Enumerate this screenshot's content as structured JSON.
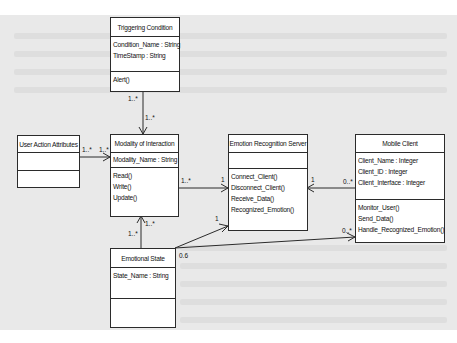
{
  "classes": {
    "triggering_condition": {
      "name": "Triggering Condition",
      "attributes": [
        "Condition_Name : String",
        "TimeStamp : String"
      ],
      "operations": [
        "Alert()"
      ]
    },
    "modality_of_interaction": {
      "name": "Modality of Interaction",
      "attributes": [
        "Modality_Name : String"
      ],
      "operations": [
        "Read()",
        "Write()",
        "Update()"
      ]
    },
    "user_action_attributes": {
      "name": "User Action Attributes",
      "attributes": [],
      "operations": []
    },
    "emotion_recognition_server": {
      "name": "Emotion Recognition Server",
      "attributes": [],
      "operations": [
        "Connect_Client()",
        "Disconnect_Client()",
        "Receive_Data()",
        "Recognized_Emotion()"
      ]
    },
    "mobile_client": {
      "name": "Mobile Client",
      "attributes": [
        "Client_Name : Integer",
        "Client_ID : Integer",
        "Client_Interface : Integer"
      ],
      "operations": [
        "Monitor_User()",
        "Send_Data()",
        "Handle_Recognized_Emotion()"
      ]
    },
    "emotional_state": {
      "name": "Emotional State",
      "attributes": [
        "State_Name : String"
      ],
      "operations": []
    }
  },
  "associations": [
    {
      "from": "Triggering Condition",
      "to": "Modality of Interaction",
      "from_mult": "1..*",
      "to_mult": "1..*"
    },
    {
      "from": "User Action Attributes",
      "to": "Modality of Interaction",
      "from_mult": "1..*",
      "to_mult": "1..*"
    },
    {
      "from": "Modality of Interaction",
      "to": "Emotion Recognition Server",
      "from_mult": "1..*",
      "to_mult": "1"
    },
    {
      "from": "Mobile Client",
      "to": "Emotion Recognition Server",
      "from_mult": "0..*",
      "to_mult": "1"
    },
    {
      "from": "Emotional State",
      "to": "Modality of Interaction",
      "from_mult": "1..*",
      "to_mult": "1..*"
    },
    {
      "from": "Emotional State",
      "to": "Emotion Recognition Server",
      "from_mult": "0.6",
      "to_mult": "1"
    },
    {
      "from": "Emotional State",
      "to": "Mobile Client",
      "from_mult": "0.6",
      "to_mult": "0..*"
    }
  ],
  "multiplicities": {
    "tc_bottom": "1..*",
    "moi_top": "1..*",
    "uaa_right": "1..*",
    "moi_left": "1..*",
    "moi_right": "1..*",
    "ers_left_top": "1",
    "ers_right": "1",
    "mc_left_top": "0..*",
    "moi_bottom_left": "1..*",
    "moi_bottom_right": "1..*",
    "ers_left_bottom": "1",
    "es_right": "0.6",
    "mc_left_bottom": "0..*"
  },
  "colors": {
    "page_bg": "#e9e9e9",
    "line": "#2b2b2b",
    "box_bg": "#ffffff"
  }
}
